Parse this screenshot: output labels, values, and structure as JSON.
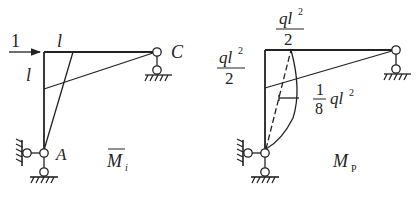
{
  "left_diagram": {
    "title": "M",
    "title_subscript": "i",
    "load_label": "1",
    "beam_length_label": "l",
    "column_height_label": "l",
    "node_a_label": "A",
    "node_c_label": "C"
  },
  "right_diagram": {
    "title": "M",
    "title_subscript": "P",
    "top_moment": {
      "numerator": "ql",
      "power": "2",
      "denominator": "2"
    },
    "left_moment": {
      "numerator": "ql",
      "power": "2",
      "denominator": "2"
    },
    "mid_moment": {
      "numerator": "1",
      "denominator": "8",
      "value": "ql",
      "power": "2"
    }
  },
  "colors": {
    "line": "#222222",
    "background": "#ffffff"
  }
}
